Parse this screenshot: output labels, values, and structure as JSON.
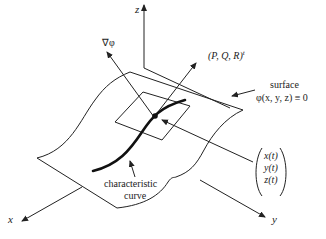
{
  "diagram": {
    "axes": {
      "x": "x",
      "y": "y",
      "z": "z"
    },
    "labels": {
      "gradient": "∇φ",
      "direction_vector": "(P, Q, R)",
      "direction_superscript": "t",
      "surface_title": "surface",
      "surface_equation": "φ(x, y, z) ≡ 0",
      "curve_line1": "characteristic",
      "curve_line2": "curve",
      "param_x": "x(t)",
      "param_y": "y(t)",
      "param_z": "z(t)"
    },
    "colors": {
      "line": "#222222",
      "background": "#ffffff"
    }
  }
}
